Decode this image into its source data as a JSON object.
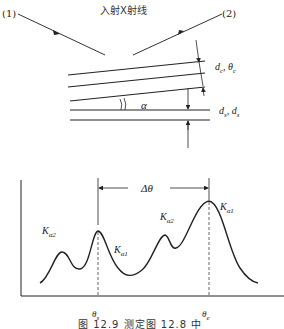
{
  "top_diagram": {
    "title": "入射X射线",
    "beam_1_label": "(1)",
    "beam_2_label": "(2)",
    "angle_label": "α",
    "upper_layer_label": "d_c, θ_c",
    "lower_layer_label": "d_s, d_s"
  },
  "bottom_diagram": {
    "delta_label": "Δθ",
    "peaks": [
      {
        "label": "K",
        "sub": "α2",
        "position": "left-small"
      },
      {
        "label": "K",
        "sub": "α1",
        "position": "theta-s"
      },
      {
        "label": "K",
        "sub": "α2",
        "position": "right-small"
      },
      {
        "label": "K",
        "sub": "α1",
        "position": "theta-e"
      }
    ],
    "theta_s_label": "θs",
    "theta_e_label": "θe"
  },
  "caption": "图 12.9  测定图 12.8 中",
  "colors": {
    "line": "#222222",
    "background": "#ffffff"
  }
}
